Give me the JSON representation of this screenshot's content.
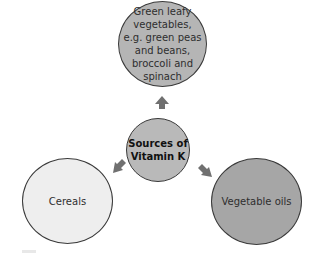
{
  "diagram": {
    "center": {
      "label": "Sources of Vitamin K",
      "line1": "Sources of",
      "line2": "Vitamin K",
      "fill": "#b9b9b9"
    },
    "nodes": [
      {
        "id": "top",
        "label": "Green leafy vegetables, e.g. green peas and beans, broccoli and spinach",
        "fill": "#b5b5b5"
      },
      {
        "id": "left",
        "label": "Cereals",
        "fill": "#eeeeee"
      },
      {
        "id": "right",
        "label": "Vegetable oils",
        "fill": "#a6a6a6"
      }
    ],
    "arrow_color": "#707070"
  }
}
